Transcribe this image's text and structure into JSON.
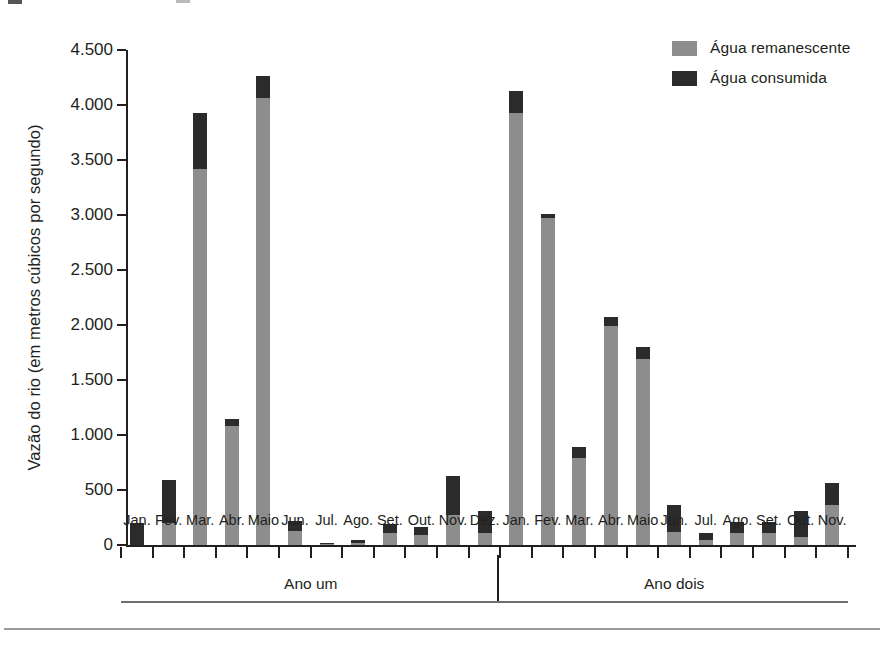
{
  "chart_data": {
    "type": "bar",
    "stacked": true,
    "title": "",
    "subtitle": "",
    "xlabel": "",
    "ylabel": "Vazão do rio (em metros cúbicos por segundo)",
    "ylim": [
      0,
      4500
    ],
    "ytick_values": [
      0,
      500,
      1000,
      1500,
      2000,
      2500,
      3000,
      3500,
      4000,
      4500
    ],
    "ytick_labels": [
      "0",
      "500",
      "1.000",
      "1.500",
      "2.000",
      "2.500",
      "3.000",
      "3.500",
      "4.000",
      "4.500"
    ],
    "grid": false,
    "legend_position": "top-right",
    "legend": [
      {
        "name": "Água remanescente",
        "color": "#8d8d8d"
      },
      {
        "name": "Água consumida",
        "color": "#2b2b2b"
      }
    ],
    "series": [
      {
        "name": "Água remanescente",
        "color": "#8d8d8d",
        "values": [
          0,
          200,
          3420,
          1080,
          4060,
          130,
          10,
          20,
          110,
          90,
          270,
          110,
          3930,
          2970,
          790,
          1990,
          1690,
          120,
          50,
          110,
          105,
          75,
          360
        ]
      },
      {
        "name": "Água consumida",
        "color": "#2b2b2b",
        "values": [
          200,
          390,
          510,
          70,
          200,
          90,
          10,
          30,
          80,
          70,
          360,
          200,
          200,
          40,
          100,
          80,
          110,
          240,
          60,
          100,
          100,
          235,
          200
        ]
      }
    ],
    "totals": [
      200,
      590,
      3930,
      1150,
      4260,
      220,
      20,
      50,
      190,
      160,
      630,
      310,
      4130,
      3010,
      890,
      2070,
      1800,
      360,
      110,
      210,
      205,
      310,
      560
    ],
    "categories": [
      "Jan.",
      "Fev.",
      "Mar.",
      "Abr.",
      "Maio",
      "Jun.",
      "Jul.",
      "Ago.",
      "Set.",
      "Out.",
      "Nov.",
      "Dez.",
      "Jan.",
      "Fev.",
      "Mar.",
      "Abr.",
      "Maio",
      "Jun.",
      "Jul.",
      "Ago.",
      "Set.",
      "Out.",
      "Nov."
    ],
    "groups": [
      {
        "label": "Ano um",
        "start_index": 0,
        "end_index": 11
      },
      {
        "label": "Ano dois",
        "start_index": 12,
        "end_index": 22
      }
    ]
  }
}
